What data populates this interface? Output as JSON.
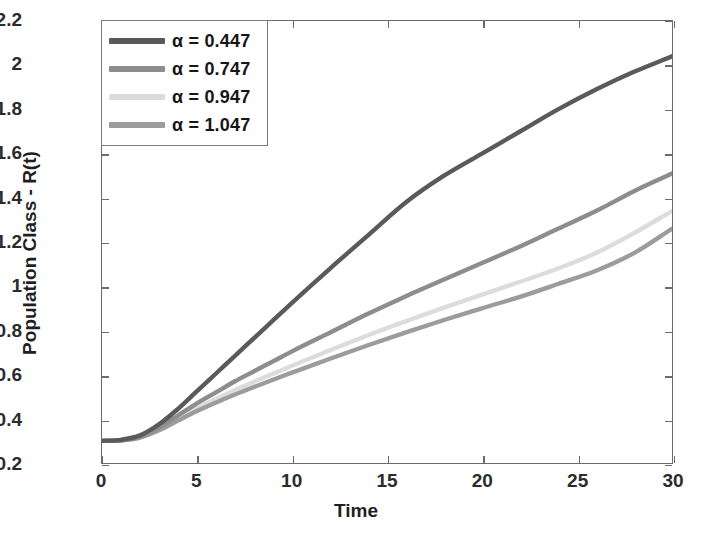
{
  "chart_data": {
    "type": "line",
    "title": "",
    "xlabel": "Time",
    "ylabel": "Population Class - R(t)",
    "xlim": [
      0,
      30
    ],
    "ylim": [
      0.2,
      2.2
    ],
    "xticks": [
      0,
      5,
      10,
      15,
      20,
      25,
      30
    ],
    "yticks": [
      0.2,
      0.4,
      0.6,
      0.8,
      1,
      1.2,
      1.4,
      1.6,
      1.8,
      2,
      2.2
    ],
    "xtick_labels": [
      "0",
      "5",
      "10",
      "15",
      "20",
      "25",
      "30"
    ],
    "ytick_labels": [
      "0.2",
      "0.4",
      "0.6",
      "0.8",
      "1",
      "1.2",
      "1.4",
      "1.6",
      "1.8",
      "2",
      "2.2"
    ],
    "grid": false,
    "legend_position": "top-left",
    "x": [
      0,
      1,
      2,
      3,
      4,
      5,
      6,
      7,
      8,
      9,
      10,
      12,
      14,
      16,
      18,
      20,
      22,
      24,
      26,
      28,
      30
    ],
    "series": [
      {
        "name": "alpha = 0.447",
        "label": "α = 0.447",
        "alpha": 0.447,
        "color": "#5a5a5a",
        "values": [
          0.3,
          0.305,
          0.325,
          0.375,
          0.445,
          0.525,
          0.605,
          0.685,
          0.765,
          0.845,
          0.925,
          1.08,
          1.23,
          1.38,
          1.5,
          1.6,
          1.7,
          1.8,
          1.89,
          1.97,
          2.04
        ]
      },
      {
        "name": "alpha = 0.747",
        "label": "α = 0.747",
        "alpha": 0.747,
        "color": "#8d8d8d",
        "values": [
          0.3,
          0.303,
          0.32,
          0.36,
          0.415,
          0.47,
          0.52,
          0.57,
          0.615,
          0.66,
          0.705,
          0.79,
          0.875,
          0.955,
          1.03,
          1.105,
          1.18,
          1.26,
          1.34,
          1.43,
          1.51
        ]
      },
      {
        "name": "alpha = 0.947",
        "label": "α = 0.947",
        "alpha": 0.947,
        "color": "#dcdcdc",
        "values": [
          0.3,
          0.302,
          0.317,
          0.352,
          0.4,
          0.448,
          0.49,
          0.53,
          0.568,
          0.604,
          0.64,
          0.71,
          0.778,
          0.842,
          0.903,
          0.962,
          1.02,
          1.08,
          1.15,
          1.24,
          1.34
        ]
      },
      {
        "name": "alpha = 1.047",
        "label": "α = 1.047",
        "alpha": 1.047,
        "color": "#9c9c9c",
        "values": [
          0.3,
          0.302,
          0.315,
          0.348,
          0.392,
          0.435,
          0.474,
          0.51,
          0.544,
          0.577,
          0.609,
          0.672,
          0.733,
          0.791,
          0.847,
          0.9,
          0.952,
          1.01,
          1.07,
          1.15,
          1.26
        ]
      }
    ]
  },
  "axes": {
    "frame_color": "#6b6b6b",
    "background": "#ffffff"
  }
}
